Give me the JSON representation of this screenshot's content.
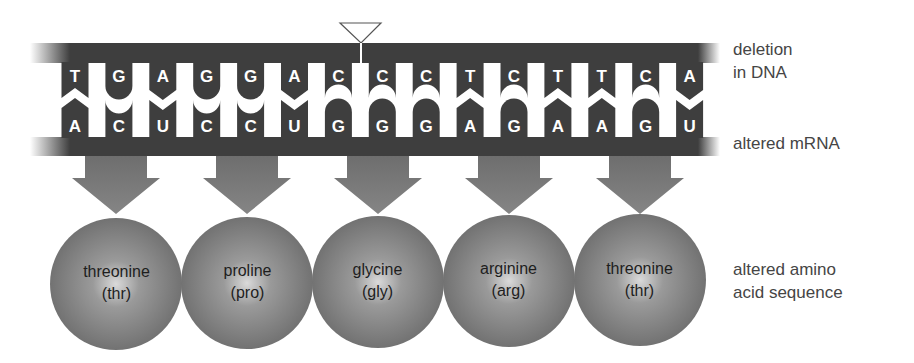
{
  "dna": {
    "label_line1": "deletion",
    "label_line2": "in DNA",
    "bases": [
      "T",
      "G",
      "A",
      "G",
      "G",
      "A",
      "C",
      "C",
      "C",
      "T",
      "C",
      "T",
      "T",
      "C",
      "A"
    ],
    "deletion_marker_after_index": 6
  },
  "mrna": {
    "label": "altered mRNA",
    "bases": [
      "A",
      "C",
      "U",
      "C",
      "C",
      "U",
      "G",
      "G",
      "G",
      "A",
      "G",
      "A",
      "A",
      "G",
      "U"
    ]
  },
  "amino_acids": {
    "label_line1": "altered amino",
    "label_line2": "acid sequence",
    "items": [
      {
        "name": "threonine",
        "abbr": "(thr)"
      },
      {
        "name": "proline",
        "abbr": "(pro)"
      },
      {
        "name": "glycine",
        "abbr": "(gly)"
      },
      {
        "name": "arginine",
        "abbr": "(arg)"
      },
      {
        "name": "threonine",
        "abbr": "(thr)"
      }
    ]
  },
  "colors": {
    "strand": "#3e3e3e",
    "base_text": "#ffffff",
    "arrow": "#7a7a7a",
    "sphere_center": "#d8d8d8",
    "sphere_edge": "#707070",
    "label_text": "#454545"
  }
}
